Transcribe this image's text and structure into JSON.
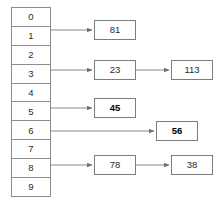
{
  "diagram": {
    "colors": {
      "border": "#8c8c8c",
      "node_border": "#7d7d7d",
      "line": "#8a8a8a",
      "text": "#2b2b2b",
      "background": "#ffffff"
    },
    "buckets": [
      {
        "index": "0",
        "occupied": false
      },
      {
        "index": "1",
        "occupied": true
      },
      {
        "index": "2",
        "occupied": false
      },
      {
        "index": "3",
        "occupied": true
      },
      {
        "index": "4",
        "occupied": false
      },
      {
        "index": "5",
        "occupied": true
      },
      {
        "index": "6",
        "occupied": true
      },
      {
        "index": "7",
        "occupied": false
      },
      {
        "index": "8",
        "occupied": true
      },
      {
        "index": "9",
        "occupied": false
      }
    ],
    "nodes": [
      {
        "id": "n81",
        "value": "81",
        "bucket": "1",
        "bold": false,
        "x": 94,
        "y": 20,
        "w": 42,
        "h": 20
      },
      {
        "id": "n23",
        "value": "23",
        "bucket": "3",
        "bold": false,
        "x": 94,
        "y": 60,
        "w": 42,
        "h": 20
      },
      {
        "id": "n113",
        "value": "113",
        "bucket": "3",
        "bold": false,
        "x": 171,
        "y": 60,
        "w": 42,
        "h": 20
      },
      {
        "id": "n45",
        "value": "45",
        "bucket": "5",
        "bold": true,
        "x": 94,
        "y": 98,
        "w": 42,
        "h": 20
      },
      {
        "id": "n56",
        "value": "56",
        "bucket": "6",
        "bold": true,
        "x": 156,
        "y": 121,
        "w": 42,
        "h": 20
      },
      {
        "id": "n78",
        "value": "78",
        "bucket": "8",
        "bold": false,
        "x": 94,
        "y": 155,
        "w": 42,
        "h": 20
      },
      {
        "id": "n38",
        "value": "38",
        "bucket": "8",
        "bold": false,
        "x": 171,
        "y": 155,
        "w": 42,
        "h": 20
      }
    ],
    "arrows": [
      {
        "id": "a1",
        "from": "bucket-1",
        "to": "n81",
        "x1": 51,
        "y1": 30,
        "x2": 92,
        "y2": 30
      },
      {
        "id": "a2",
        "from": "bucket-3",
        "to": "n23",
        "x1": 51,
        "y1": 70,
        "x2": 92,
        "y2": 70
      },
      {
        "id": "a3",
        "from": "n23",
        "to": "n113",
        "x1": 136,
        "y1": 70,
        "x2": 169,
        "y2": 70
      },
      {
        "id": "a4",
        "from": "bucket-5",
        "to": "n45",
        "x1": 51,
        "y1": 108,
        "x2": 92,
        "y2": 108
      },
      {
        "id": "a5",
        "from": "bucket-6",
        "to": "n56",
        "x1": 51,
        "y1": 131,
        "x2": 154,
        "y2": 131
      },
      {
        "id": "a6",
        "from": "bucket-8",
        "to": "n78",
        "x1": 51,
        "y1": 165,
        "x2": 92,
        "y2": 165
      },
      {
        "id": "a7",
        "from": "n78",
        "to": "n38",
        "x1": 136,
        "y1": 165,
        "x2": 169,
        "y2": 165
      }
    ]
  }
}
